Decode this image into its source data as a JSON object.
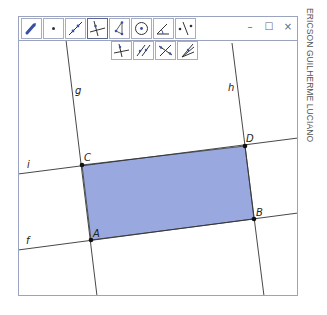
{
  "app": {
    "author_vertical_text": "ERICSON GUILHERME LUCIANO",
    "window_controls": {
      "minimize": "–",
      "maximize": "☐",
      "close": "×"
    }
  },
  "toolbar": {
    "tools": [
      {
        "name": "move-tool",
        "icon": "move-arrow-icon",
        "selected": false
      },
      {
        "name": "point-tool",
        "icon": "point-icon",
        "selected": false
      },
      {
        "name": "line-tool",
        "icon": "line-through-two-points-icon",
        "selected": false
      },
      {
        "name": "perpendicular-line-tool",
        "icon": "perpendicular-line-icon",
        "selected": true
      },
      {
        "name": "polygon-tool",
        "icon": "polygon-icon",
        "selected": false
      },
      {
        "name": "circle-tool",
        "icon": "circle-with-center-icon",
        "selected": false
      },
      {
        "name": "angle-tool",
        "icon": "angle-icon",
        "selected": false
      },
      {
        "name": "reflect-tool",
        "icon": "reflect-about-line-icon",
        "selected": false
      }
    ],
    "subtools": [
      {
        "name": "perpendicular-line-subtool",
        "icon": "perpendicular-line-icon"
      },
      {
        "name": "parallel-line-subtool",
        "icon": "parallel-line-icon"
      },
      {
        "name": "perpendicular-bisector-subtool",
        "icon": "perpendicular-bisector-icon"
      },
      {
        "name": "angle-bisector-subtool",
        "icon": "angle-bisector-icon"
      }
    ]
  },
  "canvas": {
    "polygon_fill": "#99a9e0",
    "polygon_stroke": "#333333",
    "lines": [
      {
        "label": "g",
        "x1": 66,
        "y1": 40,
        "x2": 97,
        "y2": 296,
        "label_x": 75,
        "label_y": 94
      },
      {
        "label": "h",
        "x1": 232,
        "y1": 43,
        "x2": 264,
        "y2": 296,
        "label_x": 228,
        "label_y": 91
      },
      {
        "label": "i",
        "x1": 18,
        "y1": 174,
        "x2": 298,
        "y2": 138,
        "label_x": 27,
        "label_y": 168
      },
      {
        "label": "f",
        "x1": 18,
        "y1": 250,
        "x2": 298,
        "y2": 213,
        "label_x": 26,
        "label_y": 244
      }
    ],
    "points": [
      {
        "label": "A",
        "x": 91,
        "y": 240,
        "label_x": 93,
        "label_y": 237
      },
      {
        "label": "B",
        "x": 254,
        "y": 219,
        "label_x": 256,
        "label_y": 216
      },
      {
        "label": "C",
        "x": 82,
        "y": 165,
        "label_x": 84,
        "label_y": 161
      },
      {
        "label": "D",
        "x": 245,
        "y": 146,
        "label_x": 246,
        "label_y": 142
      }
    ]
  }
}
